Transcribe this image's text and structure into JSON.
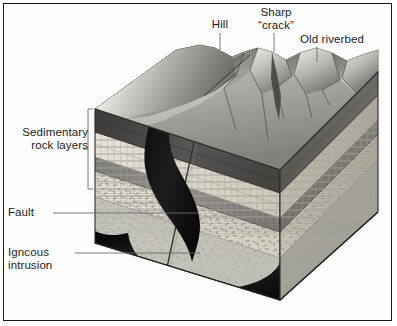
{
  "figure": {
    "type": "geology-block-diagram",
    "frame_color": "#1a1a1a",
    "background_color": "#ffffff"
  },
  "labels": {
    "hill": "Hill",
    "sharp_crack": "Sharp\n“crack”",
    "old_riverbed": "Old riverbed",
    "sedimentary": "Sedimentary\nrock layers",
    "fault": "Fault",
    "igneous": "Igncous\nintrusion"
  },
  "callouts": [
    {
      "name": "hill",
      "label": "Hill",
      "leader": "vertical-down"
    },
    {
      "name": "sharp-crack",
      "label": "Sharp “crack”",
      "leader": "vertical-down"
    },
    {
      "name": "old-riverbed",
      "label": "Old riverbed",
      "leader": "vertical-down"
    },
    {
      "name": "sedimentary-rock-layers",
      "label": "Sedimentary rock layers",
      "leader": "bracket-right"
    },
    {
      "name": "fault",
      "label": "Fault",
      "leader": "horizontal-right"
    },
    {
      "name": "igneous-intrusion",
      "label": "Igncous intrusion",
      "leader": "horizontal-right"
    }
  ],
  "strata": [
    {
      "name": "topsoil-dark-layer",
      "tone": "#4a4a4a",
      "texture": "dark-massive"
    },
    {
      "name": "pale-bedded-layer",
      "tone": "#dedad0",
      "texture": "brick-bedding"
    },
    {
      "name": "mid-gray-shale-layer",
      "tone": "#8d8d8d",
      "texture": "fine-banded"
    },
    {
      "name": "conglomerate-layer",
      "tone": "#e2ded4",
      "texture": "pebble-clasts"
    },
    {
      "name": "basement-rock",
      "tone": "#c9c9c4",
      "texture": "speckled"
    }
  ],
  "features": {
    "igneous_intrusion_color": "#151515",
    "fault_line_color": "#2a2a2a",
    "terrain_highlight": "#f0efe9",
    "terrain_shadow": "#5e5e5e"
  },
  "colors": {
    "ink": "#1c1c1c",
    "leader": "#6a6a6a"
  }
}
